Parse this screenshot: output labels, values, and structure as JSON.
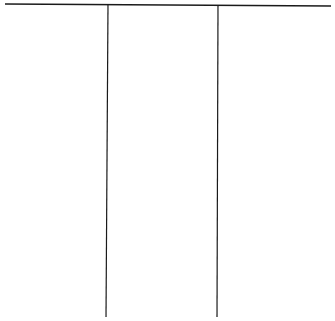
{
  "diagram": {
    "type": "three-column-chart",
    "columns": [
      {
        "header": "",
        "items": []
      },
      {
        "header": "",
        "items": []
      },
      {
        "header": "",
        "items": []
      }
    ],
    "line_color": "#1a1a1a",
    "background": "#ffffff"
  }
}
